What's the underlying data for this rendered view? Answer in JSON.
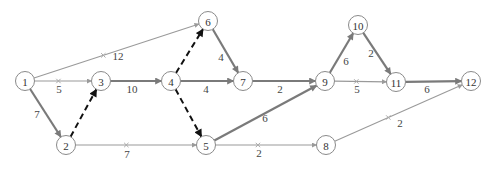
{
  "diagram": {
    "type": "activity-network",
    "nodes": [
      {
        "id": "1",
        "label": "1",
        "x": 25,
        "y": 81
      },
      {
        "id": "2",
        "label": "2",
        "x": 66,
        "y": 145
      },
      {
        "id": "3",
        "label": "3",
        "x": 101,
        "y": 81
      },
      {
        "id": "4",
        "label": "4",
        "x": 171,
        "y": 81
      },
      {
        "id": "5",
        "label": "5",
        "x": 206,
        "y": 145
      },
      {
        "id": "6",
        "label": "6",
        "x": 208,
        "y": 21
      },
      {
        "id": "7",
        "label": "7",
        "x": 243,
        "y": 81
      },
      {
        "id": "8",
        "label": "8",
        "x": 326,
        "y": 145
      },
      {
        "id": "9",
        "label": "9",
        "x": 325,
        "y": 81
      },
      {
        "id": "10",
        "label": "10",
        "x": 358,
        "y": 25
      },
      {
        "id": "11",
        "label": "11",
        "x": 396,
        "y": 82
      },
      {
        "id": "12",
        "label": "12",
        "x": 471,
        "y": 81
      }
    ],
    "edges": [
      {
        "from": "1",
        "to": "6",
        "label": "12",
        "style": "thin",
        "cut": true,
        "lx": 118,
        "ly": 56
      },
      {
        "from": "1",
        "to": "3",
        "label": "5",
        "style": "thin",
        "cut": true,
        "lx": 59,
        "ly": 89
      },
      {
        "from": "1",
        "to": "2",
        "label": "7",
        "style": "thick",
        "cut": false,
        "lx": 37,
        "ly": 114
      },
      {
        "from": "2",
        "to": "3",
        "label": "",
        "style": "dashed",
        "cut": false,
        "lx": 0,
        "ly": 0
      },
      {
        "from": "2",
        "to": "5",
        "label": "7",
        "style": "thin",
        "cut": true,
        "lx": 127,
        "ly": 154
      },
      {
        "from": "3",
        "to": "4",
        "label": "10",
        "style": "thick",
        "cut": false,
        "lx": 132,
        "ly": 89
      },
      {
        "from": "4",
        "to": "6",
        "label": "",
        "style": "dashed",
        "cut": false,
        "lx": 0,
        "ly": 0
      },
      {
        "from": "4",
        "to": "7",
        "label": "4",
        "style": "thick",
        "cut": false,
        "lx": 206,
        "ly": 89
      },
      {
        "from": "4",
        "to": "5",
        "label": "",
        "style": "dashed",
        "cut": false,
        "lx": 0,
        "ly": 0
      },
      {
        "from": "6",
        "to": "7",
        "label": "4",
        "style": "thick",
        "cut": false,
        "lx": 221,
        "ly": 57
      },
      {
        "from": "7",
        "to": "9",
        "label": "2",
        "style": "thick",
        "cut": false,
        "lx": 280,
        "ly": 89
      },
      {
        "from": "5",
        "to": "9",
        "label": "6",
        "style": "thick",
        "cut": false,
        "lx": 265,
        "ly": 118
      },
      {
        "from": "5",
        "to": "8",
        "label": "2",
        "style": "thin",
        "cut": true,
        "lx": 259,
        "ly": 153
      },
      {
        "from": "9",
        "to": "10",
        "label": "6",
        "style": "thick",
        "cut": false,
        "lx": 346,
        "ly": 61
      },
      {
        "from": "9",
        "to": "11",
        "label": "5",
        "style": "thin",
        "cut": true,
        "lx": 357,
        "ly": 89
      },
      {
        "from": "10",
        "to": "11",
        "label": "2",
        "style": "thick",
        "cut": false,
        "lx": 371,
        "ly": 53
      },
      {
        "from": "11",
        "to": "12",
        "label": "6",
        "style": "thick",
        "cut": false,
        "lx": 427,
        "ly": 89
      },
      {
        "from": "8",
        "to": "12",
        "label": "2",
        "style": "thin",
        "cut": true,
        "lx": 400,
        "ly": 123
      }
    ],
    "colors": {
      "thick": "#7a7a7a",
      "thin": "#9a9a9a",
      "dashed": "#111111",
      "node_stroke": "#8a8a8a"
    }
  }
}
